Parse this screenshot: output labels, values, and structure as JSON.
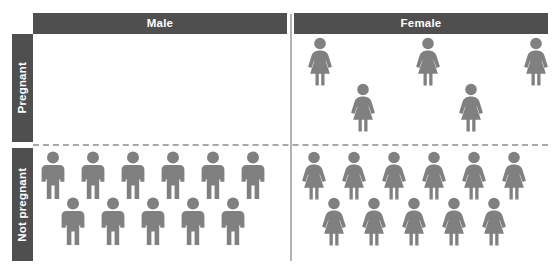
{
  "chart_data": {
    "type": "pictogram",
    "title": "",
    "figure_unit": "1 person",
    "colors": {
      "header_bar": "#4f4f4f",
      "header_text": "#ffffff",
      "figure": "#808080",
      "divider_dashed": "#a8a8a8",
      "divider_vertical": "#b3b3b3",
      "background": "#ffffff"
    },
    "columns": [
      "Male",
      "Female"
    ],
    "rows": [
      "Pregnant",
      "Not pregnant"
    ],
    "cells": [
      {
        "row": "Pregnant",
        "column": "Male",
        "count": 0,
        "icon": "male-figure-icon",
        "top_row_count": 0,
        "bottom_row_count": 0
      },
      {
        "row": "Pregnant",
        "column": "Female",
        "count": 5,
        "icon": "female-figure-icon",
        "top_row_count": 3,
        "bottom_row_count": 2
      },
      {
        "row": "Not pregnant",
        "column": "Male",
        "count": 11,
        "icon": "male-figure-icon",
        "top_row_count": 6,
        "bottom_row_count": 5
      },
      {
        "row": "Not pregnant",
        "column": "Female",
        "count": 11,
        "icon": "female-figure-icon",
        "top_row_count": 6,
        "bottom_row_count": 5
      }
    ],
    "legend": [],
    "xlabel": "",
    "ylabel": ""
  },
  "headers": {
    "male": "Male",
    "female": "Female"
  },
  "row_labels": {
    "pregnant": "Pregnant",
    "not_pregnant": "Not pregnant"
  }
}
